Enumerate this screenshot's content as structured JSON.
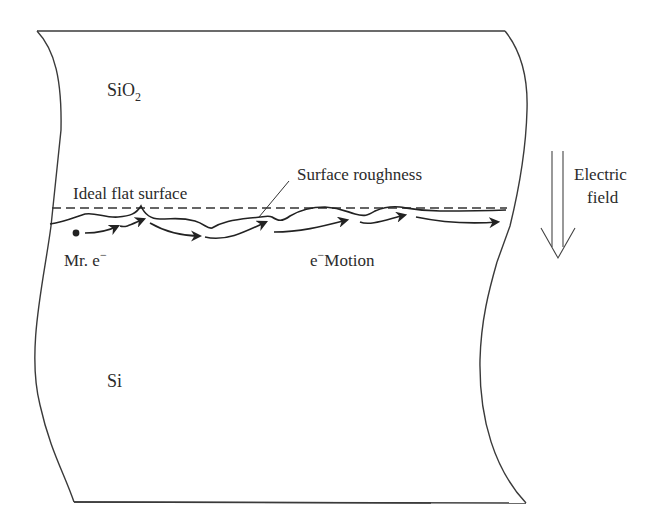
{
  "figure": {
    "labels": {
      "oxide": "SiO",
      "oxide_subscript": "2",
      "ideal_surface": "Ideal flat surface",
      "roughness": "Surface roughness",
      "electron": "Mr. e",
      "electron_superscript": "−",
      "motion_prefix": "e",
      "motion_superscript": "−",
      "motion": "Motion",
      "substrate": "Si",
      "field_line1": "Electric",
      "field_line2": "field"
    },
    "colors": {
      "line": "#2b2b2b",
      "background": "#ffffff"
    }
  }
}
